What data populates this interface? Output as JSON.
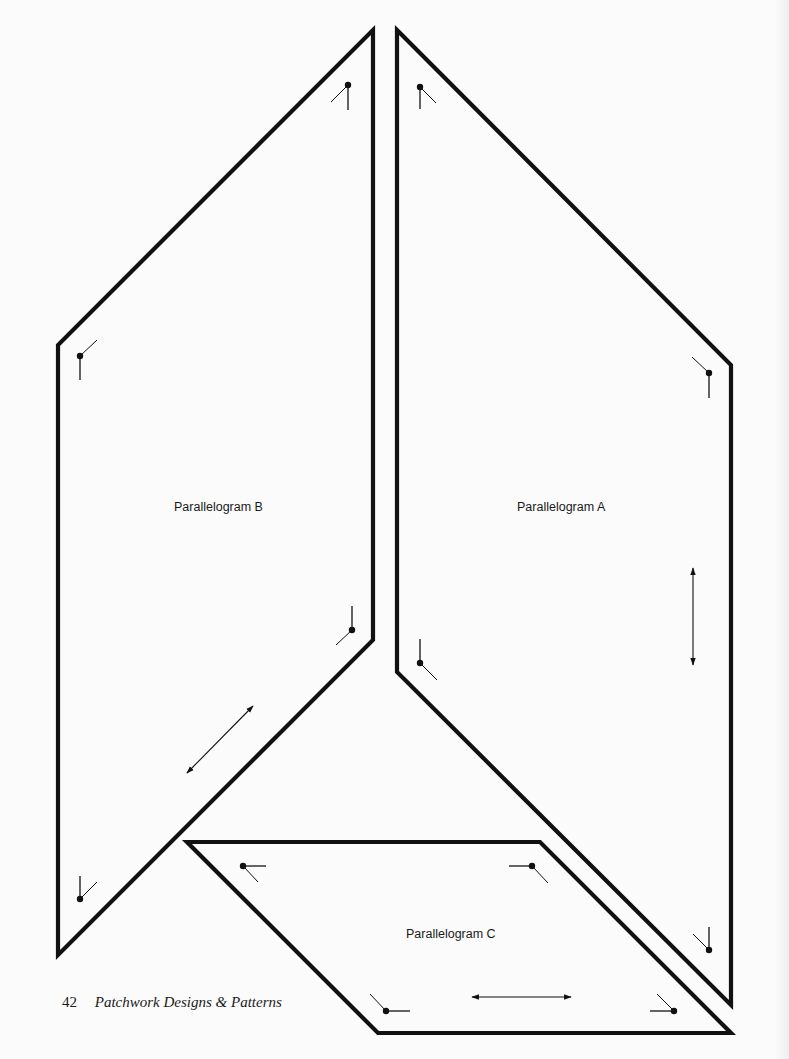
{
  "page": {
    "background": "#fbfbfb",
    "ink": "#111111"
  },
  "pieces": [
    {
      "id": "B",
      "label": "Parallelogram B",
      "label_pos": [
        174,
        500
      ],
      "points": [
        [
          373,
          30
        ],
        [
          373,
          640
        ],
        [
          58,
          955
        ],
        [
          58,
          345
        ]
      ]
    },
    {
      "id": "A",
      "label": "Parallelogram A",
      "label_pos": [
        517,
        500
      ],
      "points": [
        [
          397,
          30
        ],
        [
          731,
          365
        ],
        [
          731,
          1005
        ],
        [
          397,
          672
        ]
      ]
    },
    {
      "id": "C",
      "label": "Parallelogram C",
      "label_pos": [
        406,
        927
      ],
      "points": [
        [
          187,
          842
        ],
        [
          540,
          842
        ],
        [
          731,
          1033
        ],
        [
          378,
          1033
        ]
      ]
    }
  ],
  "seam_marks": [
    {
      "dot": [
        348,
        85
      ],
      "a": [
        348,
        110
      ],
      "b": [
        331,
        102
      ]
    },
    {
      "dot": [
        80,
        356
      ],
      "a": [
        80,
        380
      ],
      "b": [
        97,
        340
      ]
    },
    {
      "dot": [
        352,
        630
      ],
      "a": [
        352,
        606
      ],
      "b": [
        336,
        645
      ]
    },
    {
      "dot": [
        80,
        899
      ],
      "a": [
        80,
        876
      ],
      "b": [
        97,
        882
      ]
    },
    {
      "dot": [
        420,
        87
      ],
      "a": [
        420,
        109
      ],
      "b": [
        436,
        103
      ]
    },
    {
      "dot": [
        709,
        373
      ],
      "a": [
        709,
        398
      ],
      "b": [
        692,
        357
      ]
    },
    {
      "dot": [
        420,
        663
      ],
      "a": [
        420,
        639
      ],
      "b": [
        437,
        680
      ]
    },
    {
      "dot": [
        709,
        950
      ],
      "a": [
        709,
        927
      ],
      "b": [
        693,
        934
      ]
    },
    {
      "dot": [
        243,
        866
      ],
      "a": [
        266,
        866
      ],
      "b": [
        258,
        882
      ]
    },
    {
      "dot": [
        532,
        866
      ],
      "a": [
        509,
        866
      ],
      "b": [
        548,
        883
      ]
    },
    {
      "dot": [
        386,
        1011
      ],
      "a": [
        410,
        1011
      ],
      "b": [
        370,
        994
      ]
    },
    {
      "dot": [
        674,
        1011
      ],
      "a": [
        650,
        1011
      ],
      "b": [
        657,
        994
      ]
    }
  ],
  "grain_arrows": [
    {
      "piece": "B",
      "from": [
        187,
        773
      ],
      "to": [
        253,
        706
      ]
    },
    {
      "piece": "A",
      "from": [
        693,
        568
      ],
      "to": [
        693,
        665
      ]
    },
    {
      "piece": "C",
      "from": [
        472,
        997
      ],
      "to": [
        571,
        997
      ]
    }
  ],
  "footer": {
    "page_number": "42",
    "book_title": "Patchwork Designs & Patterns"
  }
}
